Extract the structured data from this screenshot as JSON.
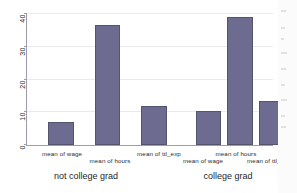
{
  "window": {
    "background_color": "#ffffff",
    "canvas_color": "#f2f4f6"
  },
  "chart_data": {
    "type": "bar",
    "title": "",
    "subtitle": "",
    "xlabel": "",
    "ylabel": "",
    "ylim": [
      0,
      40
    ],
    "yticks": [
      0,
      10,
      20,
      30,
      40
    ],
    "ytick_labels": [
      "0",
      "10",
      "20",
      "30",
      "40"
    ],
    "grid": true,
    "legend": "none",
    "bar_color": "#6d6c90",
    "bar_edge_color": "#55546f",
    "groups": [
      "not college grad",
      "college grad"
    ],
    "categories": [
      "mean of wage",
      "mean of hours",
      "mean of ttl_exp"
    ],
    "series": [
      {
        "name": "not college grad",
        "values": [
          7,
          36.5,
          12
        ]
      },
      {
        "name": "college grad",
        "values": [
          10.5,
          39,
          13.5
        ]
      }
    ],
    "bars": [
      {
        "group": "not college grad",
        "category": "mean of wage",
        "value": 7
      },
      {
        "group": "not college grad",
        "category": "mean of hours",
        "value": 36.5
      },
      {
        "group": "not college grad",
        "category": "mean of ttl_exp",
        "value": 12
      },
      {
        "group": "college grad",
        "category": "mean of wage",
        "value": 10.5
      },
      {
        "group": "college grad",
        "category": "mean of hours",
        "value": 39
      },
      {
        "group": "college grad",
        "category": "mean of ttl_exp",
        "value": 13.5
      }
    ]
  },
  "axis": {
    "ytick_0": "0",
    "ytick_1": "10",
    "ytick_2": "20",
    "ytick_3": "30",
    "ytick_4": "40"
  },
  "xaxis": {
    "labels": [
      "mean of wage",
      "mean of hours",
      "mean of ttl_exp",
      "mean of wage",
      "mean of hours",
      "mean of ttl_exp"
    ],
    "group_left": "not college grad",
    "group_right": "college grad"
  }
}
